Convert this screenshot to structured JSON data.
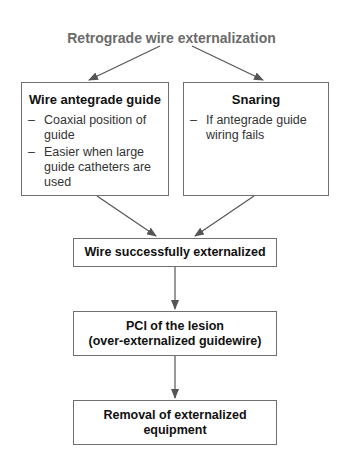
{
  "diagram": {
    "title": "Retrograde wire externalization",
    "colors": {
      "title": "#6b6b6b",
      "border": "#6f6f6f",
      "arrow": "#555555"
    },
    "left_box": {
      "heading": "Wire antegrade guide",
      "bullets": [
        "Coaxial position of guide",
        "Easier when large guide catheters are used"
      ]
    },
    "right_box": {
      "heading": "Snaring",
      "bullets": [
        "If antegrade guide wiring fails"
      ]
    },
    "step1": {
      "label": "Wire successfully externalized"
    },
    "step2": {
      "line1": "PCI of the lesion",
      "line2": "(over-externalized guidewire)"
    },
    "step3": {
      "line1": "Removal of externalized",
      "line2": "equipment"
    },
    "bullet_marker": "–"
  }
}
